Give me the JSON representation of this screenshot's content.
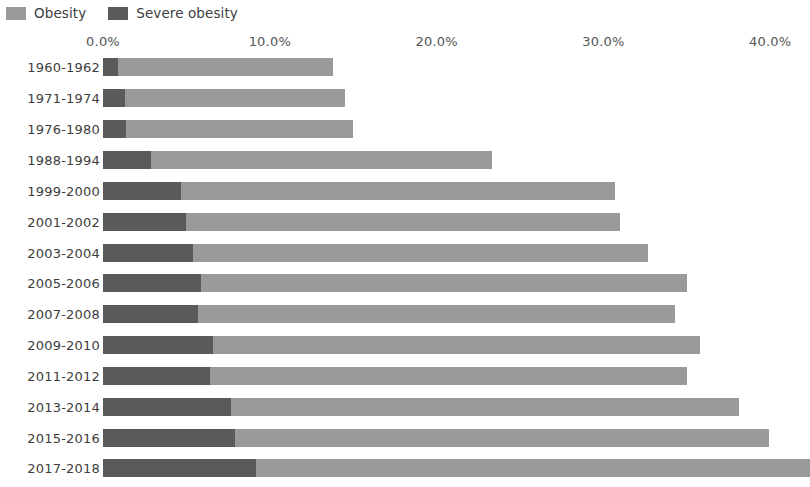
{
  "legend": {
    "position": "top-left",
    "entries": [
      {
        "label": "Obesity",
        "color": "#9a9a9a",
        "icon": "legend-swatch-icon"
      },
      {
        "label": "Severe obesity",
        "color": "#5a5a5a",
        "icon": "legend-swatch-icon"
      }
    ]
  },
  "axis": {
    "tick_labels": [
      "0.0%",
      "10.0%",
      "20.0%",
      "30.0%",
      "40.0%"
    ],
    "tick_values": [
      0,
      10,
      20,
      30,
      40
    ]
  },
  "chart_data": {
    "type": "bar",
    "orientation": "horizontal",
    "stacked": true,
    "title": "",
    "subtitle": "",
    "xlabel": "",
    "ylabel": "",
    "xlim": [
      0,
      41.3
    ],
    "grid": false,
    "legend_position": "top-left",
    "categories": [
      "1960-1962",
      "1971-1974",
      "1976-1980",
      "1988-1994",
      "1999-2000",
      "2001-2002",
      "2003-2004",
      "2005-2006",
      "2007-2008",
      "2009-2010",
      "2011-2012",
      "2013-2014",
      "2015-2016",
      "2017-2018"
    ],
    "series": [
      {
        "name": "Obesity",
        "color": "#9a9a9a",
        "values": [
          13.8,
          14.5,
          15.0,
          23.3,
          30.7,
          31.0,
          32.7,
          35.0,
          34.3,
          35.8,
          35.0,
          38.1,
          39.9,
          42.4
        ]
      },
      {
        "name": "Severe obesity",
        "color": "#5a5a5a",
        "values": [
          0.9,
          1.3,
          1.4,
          2.9,
          4.7,
          5.0,
          5.4,
          5.9,
          5.7,
          6.6,
          6.4,
          7.7,
          7.9,
          9.2
        ]
      }
    ]
  }
}
